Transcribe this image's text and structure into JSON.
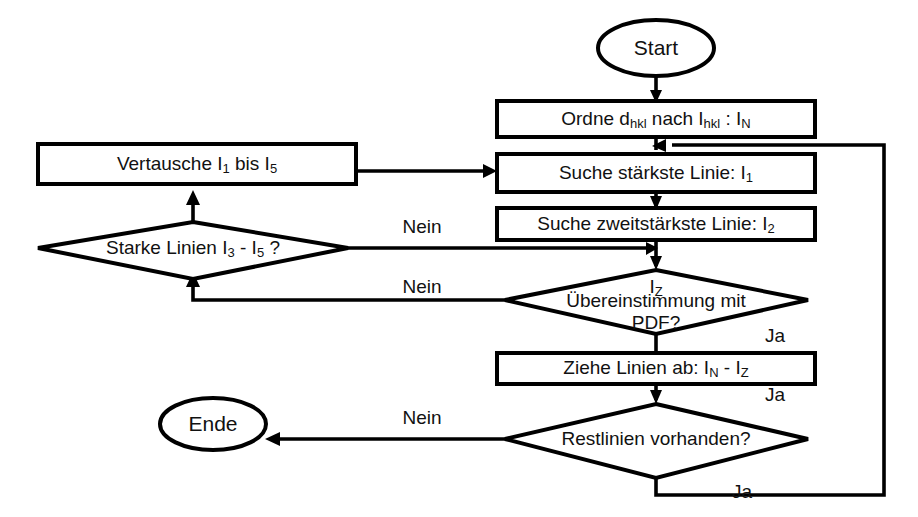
{
  "diagram": {
    "type": "flowchart",
    "language": "de",
    "colors": {
      "background": "#ffffff",
      "stroke": "#000000",
      "text": "#111111"
    }
  },
  "nodes": {
    "start": {
      "label": "Start",
      "shape": "ellipse"
    },
    "ordne": {
      "label_part1": "Ordne d",
      "sub1": "hkl",
      "label_part2": " nach I",
      "sub2": "hkl",
      "label_part3": " : I",
      "sub3": "N",
      "plain": "Ordne dhkl nach Ihkl : IN",
      "shape": "process"
    },
    "suche_staerkste": {
      "label_part1": "Suche stärkste Linie:  I",
      "sub1": "1",
      "plain": "Suche stärkste Linie: I1",
      "shape": "process"
    },
    "suche_zweitstaerkste": {
      "label_part1": "Suche zweitstärkste Linie: I",
      "sub1": "2",
      "plain": "Suche zweitstärkste Linie: I2",
      "shape": "process"
    },
    "uebereinstimmung": {
      "top_label": "I",
      "top_sub": "Z",
      "line1": "Übereinstimmung mit",
      "line2": "PDF?",
      "plain": "IZ Übereinstimmung mit PDF?",
      "shape": "decision"
    },
    "ziehe_linien": {
      "label_part1": "Ziehe Linien ab: I",
      "sub1": "N",
      "label_part2": " - I",
      "sub2": "Z",
      "plain": "Ziehe Linien ab: IN - IZ",
      "shape": "process"
    },
    "restlinien": {
      "label": "Restlinien vorhanden?",
      "shape": "decision"
    },
    "ende": {
      "label": "Ende",
      "shape": "ellipse"
    },
    "vertausche": {
      "label_part1": "Vertausche I",
      "sub1": "1",
      "label_part2": " bis I",
      "sub2": "5",
      "plain": "Vertausche I1 bis I5",
      "shape": "process"
    },
    "starke_linien": {
      "label_part1": "Starke Linien I",
      "sub1": "3",
      "label_part2": " - I",
      "sub2": "5",
      "label_part3": " ?",
      "plain": "Starke Linien I3 - I5 ?",
      "shape": "decision"
    }
  },
  "edge_labels": {
    "starke_nein": "Nein",
    "uebereinstimmung_nein": "Nein",
    "uebereinstimmung_ja": "Ja",
    "ziehe_ja": "Ja",
    "restlinien_nein": "Nein",
    "restlinien_ja": "Ja"
  }
}
